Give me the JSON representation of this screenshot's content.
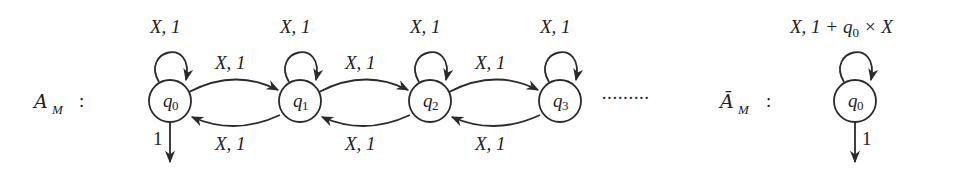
{
  "left_automaton": {
    "name_main": "A",
    "name_sub": "M",
    "colon": ":",
    "states": [
      {
        "id": "q0",
        "label_main": "q",
        "label_sub": "0",
        "self_loop": "X, 1",
        "final_weight": "1"
      },
      {
        "id": "q1",
        "label_main": "q",
        "label_sub": "1",
        "self_loop": "X, 1"
      },
      {
        "id": "q2",
        "label_main": "q",
        "label_sub": "2",
        "self_loop": "X, 1"
      },
      {
        "id": "q3",
        "label_main": "q",
        "label_sub": "3",
        "self_loop": "X, 1"
      }
    ],
    "forward_edges": [
      {
        "from": "q0",
        "to": "q1",
        "label": "X, 1"
      },
      {
        "from": "q1",
        "to": "q2",
        "label": "X, 1"
      },
      {
        "from": "q2",
        "to": "q3",
        "label": "X, 1"
      }
    ],
    "backward_edges": [
      {
        "from": "q1",
        "to": "q0",
        "label": "X, 1"
      },
      {
        "from": "q2",
        "to": "q1",
        "label": "X, 1"
      },
      {
        "from": "q3",
        "to": "q2",
        "label": "X, 1"
      }
    ],
    "continuation": "·········"
  },
  "right_automaton": {
    "name_main": "Ā",
    "name_sub": "M",
    "colon": ":",
    "state": {
      "id": "q0",
      "label_main": "q",
      "label_sub": "0"
    },
    "self_loop_prefix": "X, 1 + ",
    "self_loop_q": "q",
    "self_loop_q_sub": "0",
    "self_loop_suffix": " × X",
    "final_weight": "1"
  }
}
